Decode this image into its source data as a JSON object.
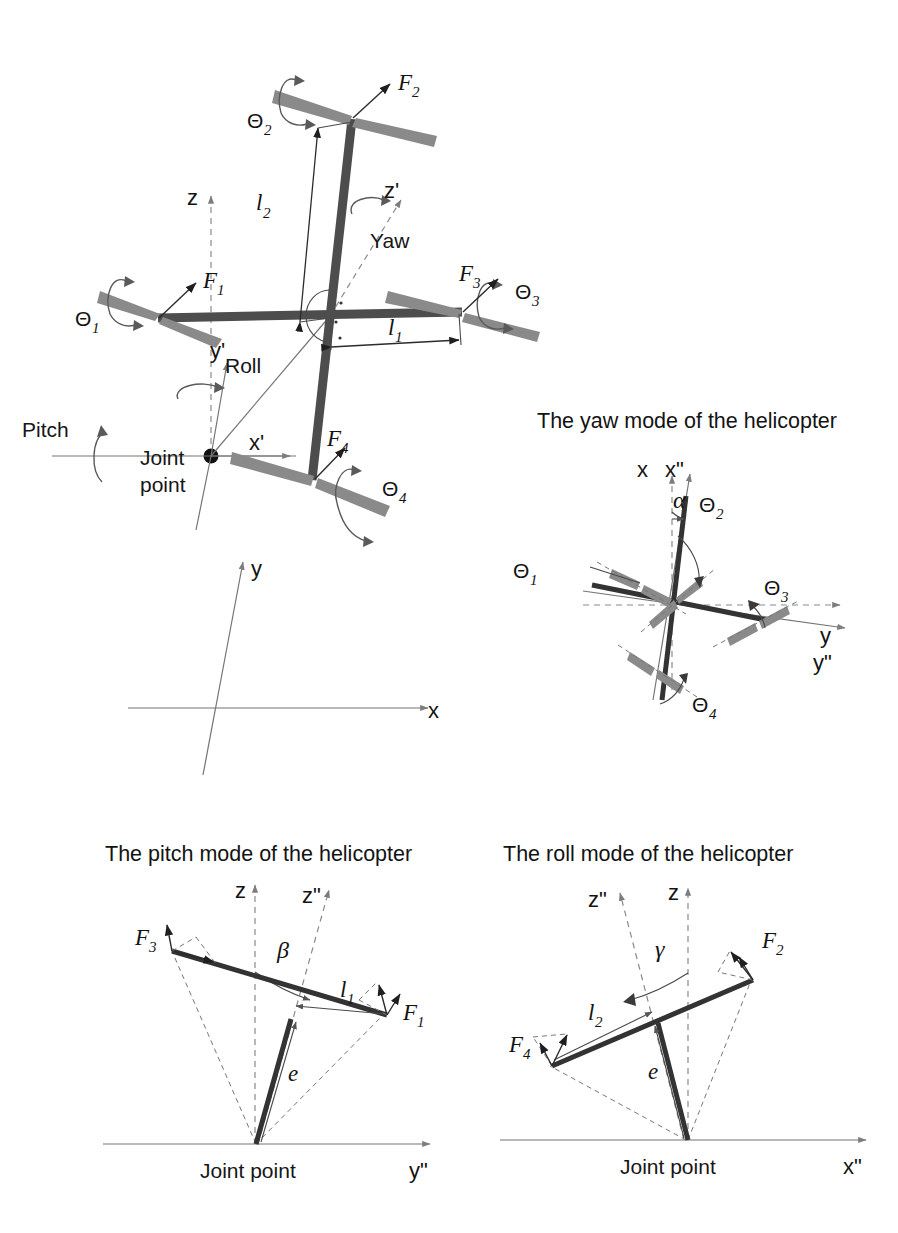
{
  "figure": {
    "kind": "technical-diagram",
    "background_color": "#ffffff",
    "ink_color": "#1a1a1a",
    "blade_color": "#8a8a8a",
    "arm_color": "#4d4d4d"
  },
  "main_diagram": {
    "name": "quadrotor-perspective-view",
    "forces": [
      {
        "label": "F",
        "sub": "1",
        "name": "force-f1"
      },
      {
        "label": "F",
        "sub": "2",
        "name": "force-f2"
      },
      {
        "label": "F",
        "sub": "3",
        "name": "force-f3"
      },
      {
        "label": "F",
        "sub": "4",
        "name": "force-f4"
      }
    ],
    "rotor_angles": [
      {
        "label": "Θ",
        "sub": "1",
        "name": "theta-1"
      },
      {
        "label": "Θ",
        "sub": "2",
        "name": "theta-2"
      },
      {
        "label": "Θ",
        "sub": "3",
        "name": "theta-3"
      },
      {
        "label": "Θ",
        "sub": "4",
        "name": "theta-4"
      }
    ],
    "lengths": [
      {
        "label": "l",
        "sub": "1",
        "name": "arm-length-l1"
      },
      {
        "label": "l",
        "sub": "2",
        "name": "arm-length-l2"
      }
    ],
    "axes": [
      {
        "label": "x",
        "name": "axis-x"
      },
      {
        "label": "y",
        "name": "axis-y"
      },
      {
        "label": "z",
        "name": "axis-z"
      },
      {
        "label": "x'",
        "name": "axis-x-prime"
      },
      {
        "label": "y'",
        "name": "axis-y-prime"
      },
      {
        "label": "z'",
        "name": "axis-z-prime"
      }
    ],
    "rotation_labels": [
      {
        "label": "Yaw",
        "name": "yaw-label"
      },
      {
        "label": "Roll",
        "name": "roll-label"
      },
      {
        "label": "Pitch",
        "name": "pitch-label"
      }
    ],
    "joint_point": {
      "line1": "Joint",
      "line2": "point",
      "name": "joint-point-label"
    }
  },
  "yaw_panel": {
    "title": "The yaw mode of the helicopter",
    "angle": {
      "label": "α",
      "name": "alpha-angle"
    },
    "rotor_angles": [
      {
        "label": "Θ",
        "sub": "1"
      },
      {
        "label": "Θ",
        "sub": "2"
      },
      {
        "label": "Θ",
        "sub": "3"
      },
      {
        "label": "Θ",
        "sub": "4"
      }
    ],
    "axes": [
      {
        "label": "x"
      },
      {
        "label": "x\""
      },
      {
        "label": "y"
      },
      {
        "label": "y\""
      }
    ]
  },
  "pitch_panel": {
    "title": "The pitch mode of the helicopter",
    "angle": {
      "label": "β",
      "name": "beta-angle"
    },
    "forces": [
      {
        "label": "F",
        "sub": "3"
      },
      {
        "label": "F",
        "sub": "1"
      }
    ],
    "lengths": [
      {
        "label": "l",
        "sub": "1"
      },
      {
        "label": "e",
        "sub": ""
      }
    ],
    "axes": [
      {
        "label": "z"
      },
      {
        "label": "z\""
      },
      {
        "label": "y\""
      }
    ],
    "joint_point": "Joint point"
  },
  "roll_panel": {
    "title": "The roll mode of the helicopter",
    "angle": {
      "label": "γ",
      "name": "gamma-angle"
    },
    "forces": [
      {
        "label": "F",
        "sub": "4"
      },
      {
        "label": "F",
        "sub": "2"
      }
    ],
    "lengths": [
      {
        "label": "l",
        "sub": "2"
      },
      {
        "label": "e",
        "sub": ""
      }
    ],
    "axes": [
      {
        "label": "z"
      },
      {
        "label": "z\""
      },
      {
        "label": "x\""
      }
    ],
    "joint_point": "Joint point"
  }
}
